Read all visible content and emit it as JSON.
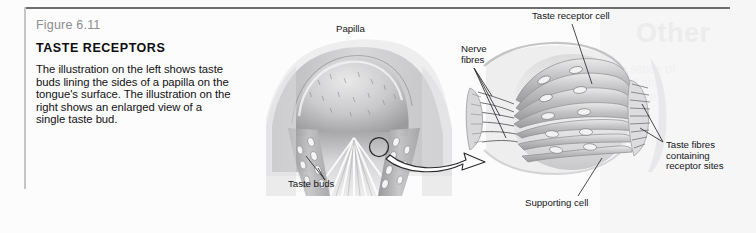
{
  "figure": {
    "number": "Figure 6.11",
    "title": "TASTE RECEPTORS",
    "body": "The illustration on the left shows taste buds lining the sides of a papilla on the tongue's surface. The illustration on the right shows an enlarged view of a single taste bud."
  },
  "labels": {
    "papilla": "Papilla",
    "nerve_fibres": "Nerve\nfibres",
    "taste_receptor_cell": "Taste receptor cell",
    "taste_buds": "Taste buds",
    "supporting_cell": "Supporting cell",
    "taste_fibres": "Taste fibres\ncontaining\nreceptor sites"
  },
  "colors": {
    "rule_top": "#6e6e70",
    "rule_left": "#c6c6c8",
    "figure_number": "#8d8d90",
    "title": "#0d0d0f",
    "body_text": "#111113",
    "label_text": "#17171a",
    "artwork_mid": "#b9b9bb",
    "artwork_dark": "#8b8b8e",
    "artwork_light": "#e4e4e6",
    "background": "#fcfcfc"
  },
  "ghost_text": {
    "title": "Other",
    "lines": [
      "the sense of",
      "smell and",
      "taste are"
    ]
  }
}
